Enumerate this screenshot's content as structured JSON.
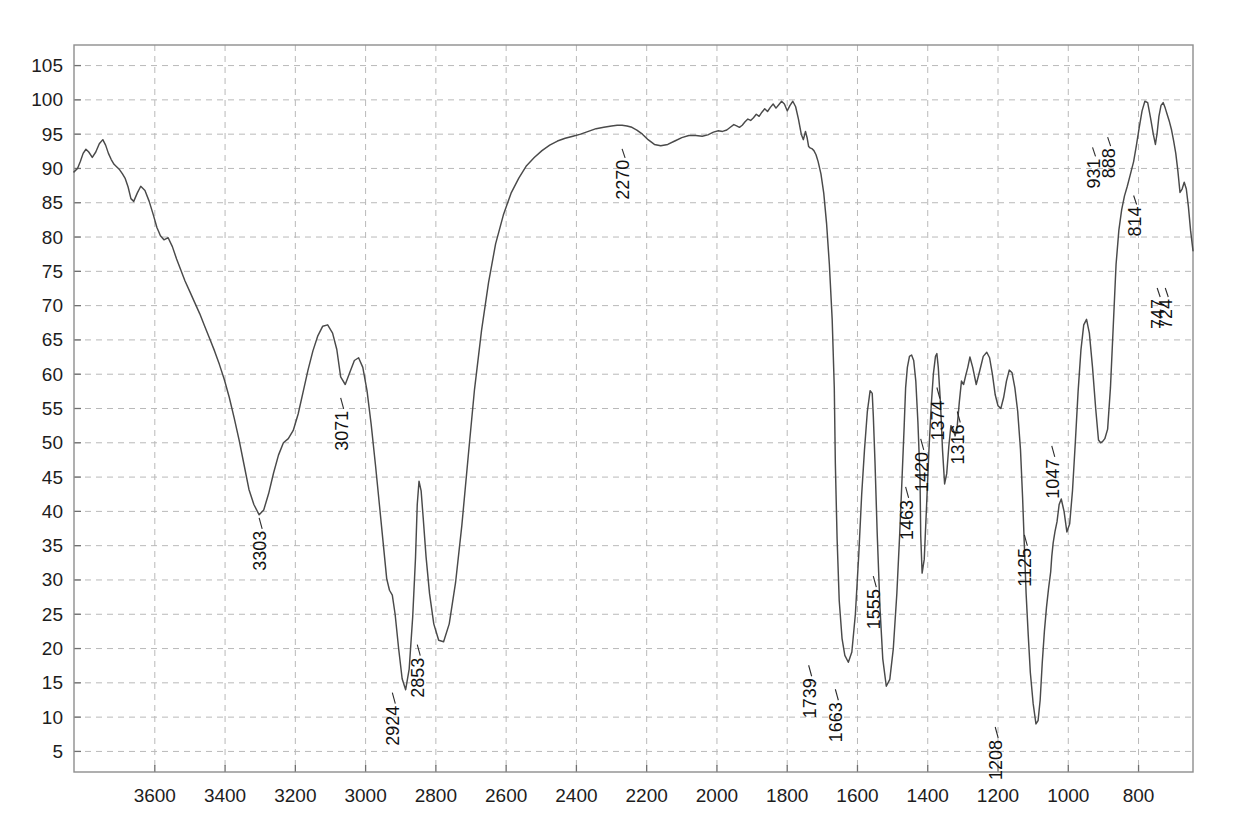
{
  "chart_data": {
    "type": "line",
    "title": "",
    "subtitle": "",
    "xlabel": "",
    "ylabel": "",
    "xlim": [
      3830,
      645
    ],
    "ylim": [
      2,
      108
    ],
    "x_axis_inverted": true,
    "grid": true,
    "legend": "none",
    "xticks": [
      3600,
      3400,
      3200,
      3000,
      2800,
      2600,
      2400,
      2200,
      2000,
      1800,
      1600,
      1400,
      1200,
      1000,
      800
    ],
    "yticks": [
      5,
      10,
      15,
      20,
      25,
      30,
      35,
      40,
      45,
      50,
      55,
      60,
      65,
      70,
      75,
      80,
      85,
      90,
      95,
      100,
      105
    ],
    "trace_color": "#4a4a4a",
    "grid_color": "#b9b9b9",
    "frame_color": "#8e8e8e",
    "annotations": [
      {
        "label": "3303",
        "x": 3303,
        "y": 39.5
      },
      {
        "label": "3071",
        "x": 3071,
        "y": 57.0
      },
      {
        "label": "2924",
        "x": 2924,
        "y": 14.0
      },
      {
        "label": "2853",
        "x": 2853,
        "y": 21.0
      },
      {
        "label": "2270",
        "x": 2270,
        "y": 93.3
      },
      {
        "label": "1739",
        "x": 1739,
        "y": 18.0
      },
      {
        "label": "1663",
        "x": 1663,
        "y": 14.5
      },
      {
        "label": "1555",
        "x": 1555,
        "y": 31.0
      },
      {
        "label": "1463",
        "x": 1463,
        "y": 44.0
      },
      {
        "label": "1420",
        "x": 1420,
        "y": 51.0
      },
      {
        "label": "1374",
        "x": 1374,
        "y": 58.5
      },
      {
        "label": "1316",
        "x": 1316,
        "y": 55.0
      },
      {
        "label": "1208",
        "x": 1208,
        "y": 9.0
      },
      {
        "label": "1125",
        "x": 1125,
        "y": 37.0
      },
      {
        "label": "1047",
        "x": 1047,
        "y": 50.0
      },
      {
        "label": "931",
        "x": 931,
        "y": 93.5
      },
      {
        "label": "888",
        "x": 888,
        "y": 95.0
      },
      {
        "label": "814",
        "x": 814,
        "y": 86.5
      },
      {
        "label": "724",
        "x": 724,
        "y": 73.0
      },
      {
        "label": "747",
        "x": 747,
        "y": 73.0
      }
    ],
    "x": [
      3830,
      3820,
      3812,
      3804,
      3796,
      3788,
      3778,
      3768,
      3758,
      3748,
      3740,
      3732,
      3724,
      3716,
      3708,
      3700,
      3692,
      3684,
      3676,
      3668,
      3660,
      3650,
      3640,
      3628,
      3616,
      3604,
      3594,
      3584,
      3574,
      3562,
      3550,
      3538,
      3526,
      3514,
      3500,
      3486,
      3472,
      3458,
      3444,
      3430,
      3416,
      3402,
      3388,
      3374,
      3360,
      3346,
      3332,
      3318,
      3303,
      3290,
      3276,
      3262,
      3248,
      3234,
      3220,
      3206,
      3192,
      3178,
      3164,
      3150,
      3136,
      3122,
      3108,
      3094,
      3082,
      3071,
      3058,
      3044,
      3032,
      3020,
      3008,
      2996,
      2984,
      2972,
      2960,
      2950,
      2940,
      2932,
      2924,
      2916,
      2906,
      2896,
      2886,
      2876,
      2866,
      2858,
      2853,
      2848,
      2842,
      2836,
      2828,
      2818,
      2806,
      2792,
      2778,
      2762,
      2744,
      2726,
      2708,
      2690,
      2670,
      2650,
      2630,
      2608,
      2586,
      2564,
      2542,
      2520,
      2498,
      2476,
      2454,
      2432,
      2410,
      2388,
      2366,
      2344,
      2322,
      2300,
      2284,
      2270,
      2256,
      2242,
      2228,
      2212,
      2196,
      2178,
      2160,
      2140,
      2120,
      2100,
      2080,
      2060,
      2042,
      2026,
      2010,
      1996,
      1984,
      1972,
      1962,
      1952,
      1944,
      1936,
      1928,
      1920,
      1912,
      1904,
      1896,
      1888,
      1880,
      1872,
      1864,
      1856,
      1848,
      1840,
      1832,
      1824,
      1816,
      1808,
      1800,
      1792,
      1784,
      1776,
      1768,
      1760,
      1754,
      1748,
      1743,
      1739,
      1735,
      1730,
      1724,
      1718,
      1712,
      1704,
      1696,
      1688,
      1680,
      1672,
      1666,
      1663,
      1658,
      1652,
      1644,
      1636,
      1626,
      1616,
      1606,
      1596,
      1588,
      1580,
      1572,
      1564,
      1558,
      1555,
      1550,
      1544,
      1536,
      1528,
      1518,
      1508,
      1498,
      1488,
      1480,
      1473,
      1467,
      1463,
      1458,
      1452,
      1446,
      1440,
      1434,
      1428,
      1422,
      1420,
      1416,
      1410,
      1404,
      1397,
      1390,
      1384,
      1378,
      1374,
      1370,
      1364,
      1358,
      1352,
      1346,
      1340,
      1334,
      1328,
      1322,
      1316,
      1310,
      1304,
      1298,
      1292,
      1286,
      1280,
      1272,
      1262,
      1252,
      1242,
      1232,
      1224,
      1216,
      1208,
      1200,
      1192,
      1184,
      1176,
      1168,
      1160,
      1152,
      1144,
      1136,
      1130,
      1125,
      1120,
      1114,
      1108,
      1100,
      1092,
      1086,
      1080,
      1074,
      1068,
      1062,
      1056,
      1050,
      1047,
      1043,
      1038,
      1032,
      1026,
      1020,
      1012,
      1004,
      996,
      988,
      980,
      972,
      964,
      956,
      948,
      940,
      931,
      922,
      914,
      908,
      902,
      896,
      888,
      880,
      872,
      864,
      856,
      848,
      840,
      832,
      824,
      814,
      806,
      798,
      790,
      782,
      774,
      766,
      758,
      752,
      747,
      742,
      736,
      730,
      724,
      718,
      712,
      706,
      700,
      694,
      688,
      682,
      676,
      670,
      664,
      658,
      652,
      645
    ],
    "y": [
      89.5,
      90.0,
      91.0,
      92.2,
      92.8,
      92.4,
      91.6,
      92.4,
      93.6,
      94.2,
      93.4,
      92.2,
      91.3,
      90.6,
      90.2,
      89.8,
      89.2,
      88.5,
      87.3,
      85.6,
      85.2,
      86.4,
      87.4,
      86.8,
      85.2,
      83.2,
      81.4,
      80.2,
      79.6,
      79.9,
      78.6,
      76.8,
      75.2,
      73.6,
      72.0,
      70.4,
      68.8,
      67.0,
      65.2,
      63.4,
      61.4,
      59.2,
      56.6,
      53.6,
      50.4,
      46.8,
      43.2,
      41.0,
      39.5,
      40.2,
      42.6,
      45.6,
      48.2,
      50.0,
      50.6,
      51.8,
      54.2,
      57.4,
      60.6,
      63.4,
      65.6,
      67.0,
      67.2,
      66.0,
      63.6,
      59.6,
      58.5,
      60.4,
      62.0,
      62.4,
      61.0,
      57.6,
      52.6,
      46.8,
      40.6,
      35.4,
      30.2,
      28.5,
      27.8,
      25.0,
      20.0,
      15.6,
      14.0,
      17.0,
      24.6,
      33.2,
      41.0,
      44.4,
      43.0,
      39.0,
      33.4,
      28.0,
      23.6,
      21.2,
      21.0,
      23.6,
      29.6,
      38.0,
      48.0,
      57.8,
      66.4,
      73.4,
      79.0,
      83.2,
      86.4,
      88.6,
      90.4,
      91.6,
      92.6,
      93.4,
      94.0,
      94.4,
      94.7,
      95.0,
      95.4,
      95.8,
      96.0,
      96.2,
      96.3,
      96.3,
      96.2,
      96.0,
      95.6,
      95.0,
      94.2,
      93.5,
      93.3,
      93.5,
      94.0,
      94.5,
      94.8,
      94.8,
      94.7,
      94.9,
      95.3,
      95.5,
      95.4,
      95.6,
      96.0,
      96.4,
      96.2,
      96.0,
      96.3,
      96.8,
      97.2,
      97.0,
      97.4,
      97.9,
      97.6,
      98.2,
      98.7,
      98.3,
      98.9,
      99.4,
      98.8,
      99.3,
      99.8,
      99.4,
      98.4,
      99.2,
      99.8,
      99.0,
      97.2,
      95.0,
      94.2,
      95.4,
      94.4,
      93.2,
      93.0,
      92.9,
      92.6,
      92.0,
      91.0,
      89.2,
      86.4,
      82.0,
      76.0,
      68.0,
      58.0,
      47.0,
      36.0,
      27.0,
      21.5,
      19.0,
      18.0,
      19.5,
      25.0,
      34.0,
      42.5,
      49.0,
      54.5,
      57.6,
      57.2,
      54.0,
      47.0,
      37.0,
      26.0,
      18.5,
      14.5,
      15.5,
      20.0,
      28.0,
      36.5,
      45.0,
      52.5,
      58.0,
      61.0,
      62.6,
      62.8,
      62.0,
      59.0,
      53.0,
      45.0,
      36.5,
      31.0,
      33.0,
      40.0,
      48.5,
      55.5,
      60.0,
      62.6,
      63.0,
      61.0,
      56.0,
      49.0,
      44.0,
      45.5,
      49.5,
      52.5,
      52.0,
      51.0,
      52.5,
      56.0,
      59.0,
      58.5,
      59.8,
      61.0,
      62.5,
      61.0,
      58.5,
      60.5,
      62.6,
      63.2,
      62.4,
      60.0,
      57.0,
      55.4,
      55.0,
      56.6,
      59.0,
      60.6,
      60.2,
      58.0,
      54.6,
      49.0,
      42.0,
      35.0,
      28.0,
      22.0,
      16.5,
      12.0,
      9.0,
      9.5,
      12.5,
      18.0,
      22.5,
      26.0,
      28.8,
      31.2,
      33.4,
      35.4,
      37.0,
      38.5,
      41.0,
      41.8,
      40.0,
      37.0,
      38.2,
      43.0,
      50.0,
      57.5,
      63.5,
      67.2,
      68.0,
      66.0,
      61.0,
      55.0,
      50.4,
      50.0,
      50.2,
      50.6,
      52.0,
      58.0,
      67.0,
      76.0,
      81.0,
      84.0,
      86.0,
      87.4,
      89.0,
      91.0,
      93.4,
      96.0,
      98.4,
      99.8,
      99.6,
      97.4,
      95.0,
      93.5,
      95.2,
      97.6,
      99.2,
      99.6,
      98.8,
      97.8,
      96.8,
      95.6,
      94.0,
      92.2,
      89.6,
      86.5,
      87.0,
      88.0,
      87.0,
      84.4,
      81.0,
      78.0,
      76.0,
      74.0,
      72.6,
      73.0,
      75.4,
      77.0,
      75.0,
      73.0,
      74.5,
      77.6,
      80.0,
      81.6,
      82.4,
      82.6,
      82.4,
      81.8,
      81.2,
      80.8,
      80.4,
      80.2,
      80.5
    ]
  }
}
